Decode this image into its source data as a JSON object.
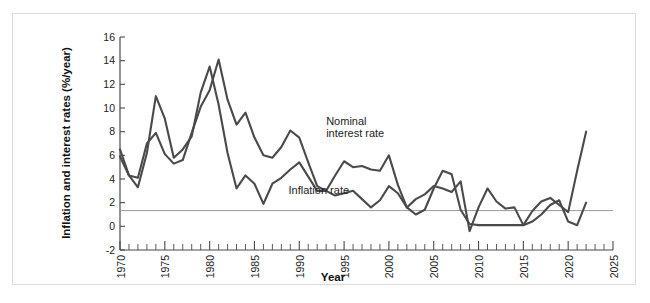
{
  "chart_data": {
    "type": "line",
    "title": "",
    "xlabel": "Year",
    "ylabel": "Inflation and interest rates (%/year)",
    "xlim": [
      1970,
      2025
    ],
    "ylim": [
      -2,
      16
    ],
    "xticks": [
      1970,
      1975,
      1980,
      1985,
      1990,
      1995,
      2000,
      2005,
      2010,
      2015,
      2020,
      2025
    ],
    "xtick_labels": [
      "1970",
      "1975",
      "1980",
      "1985",
      "1990",
      "1995",
      "2000",
      "2005",
      "2010",
      "2015",
      "2020",
      "2025"
    ],
    "yticks": [
      -2,
      0,
      2,
      4,
      6,
      8,
      10,
      12,
      14,
      16
    ],
    "ytick_labels": [
      "-2",
      "0",
      "2",
      "4",
      "6",
      "8",
      "10",
      "12",
      "14",
      "16"
    ],
    "minor_xtick_interval": 1,
    "grid": false,
    "legend_position": "inline-annotations",
    "zero_line": true,
    "line_color": "#4a4a4a",
    "zero_line_color": "#9a9a9a",
    "frame_color": "#dcdcdc",
    "series": [
      {
        "name": "Nominal interest rate",
        "label_text": "Nominal\ninterest rate",
        "label_line1": "Nominal",
        "label_line2": "interest rate",
        "label_x": 1993.0,
        "label_y": 8.6,
        "x": [
          1970,
          1971,
          1972,
          1973,
          1974,
          1975,
          1976,
          1977,
          1978,
          1979,
          1980,
          1981,
          1982,
          1983,
          1984,
          1985,
          1986,
          1987,
          1988,
          1989,
          1990,
          1991,
          1992,
          1993,
          1994,
          1995,
          1996,
          1997,
          1998,
          1999,
          2000,
          2001,
          2002,
          2003,
          2004,
          2005,
          2006,
          2007,
          2008,
          2009,
          2010,
          2011,
          2012,
          2013,
          2014,
          2015,
          2016,
          2017,
          2018,
          2019,
          2020,
          2021,
          2022
        ],
        "values": [
          6.5,
          4.3,
          4.1,
          7.0,
          7.9,
          6.1,
          5.3,
          5.6,
          7.9,
          10.1,
          11.5,
          14.1,
          10.7,
          8.6,
          9.6,
          7.5,
          6.0,
          5.8,
          6.7,
          8.1,
          7.5,
          5.4,
          3.4,
          3.0,
          4.3,
          5.5,
          5.0,
          5.1,
          4.8,
          4.7,
          6.0,
          3.5,
          1.6,
          1.0,
          1.4,
          3.2,
          4.7,
          4.4,
          1.4,
          0.2,
          0.1,
          0.1,
          0.1,
          0.1,
          0.1,
          0.1,
          0.4,
          1.0,
          1.8,
          2.2,
          0.4,
          0.1,
          2.0
        ]
      },
      {
        "name": "Inflation rate",
        "label_text": "Inflation rate",
        "label_x": 1988.8,
        "label_y": 2.7,
        "x": [
          1970,
          1971,
          1972,
          1973,
          1974,
          1975,
          1976,
          1977,
          1978,
          1979,
          1980,
          1981,
          1982,
          1983,
          1984,
          1985,
          1986,
          1987,
          1988,
          1989,
          1990,
          1991,
          1992,
          1993,
          1994,
          1995,
          1996,
          1997,
          1998,
          1999,
          2000,
          2001,
          2002,
          2003,
          2004,
          2005,
          2006,
          2007,
          2008,
          2009,
          2010,
          2011,
          2012,
          2013,
          2014,
          2015,
          2016,
          2017,
          2018,
          2019,
          2020,
          2021,
          2022
        ],
        "values": [
          5.9,
          4.3,
          3.3,
          6.2,
          11.0,
          9.1,
          5.8,
          6.5,
          7.6,
          11.3,
          13.5,
          10.3,
          6.2,
          3.2,
          4.3,
          3.6,
          1.9,
          3.6,
          4.1,
          4.8,
          5.4,
          4.2,
          3.0,
          3.0,
          2.6,
          2.8,
          3.0,
          2.3,
          1.6,
          2.2,
          3.4,
          2.8,
          1.6,
          2.3,
          2.7,
          3.4,
          3.2,
          2.9,
          3.8,
          -0.4,
          1.6,
          3.2,
          2.1,
          1.5,
          1.6,
          0.1,
          1.3,
          2.1,
          2.4,
          1.8,
          1.2,
          4.7,
          8.0
        ]
      }
    ]
  }
}
